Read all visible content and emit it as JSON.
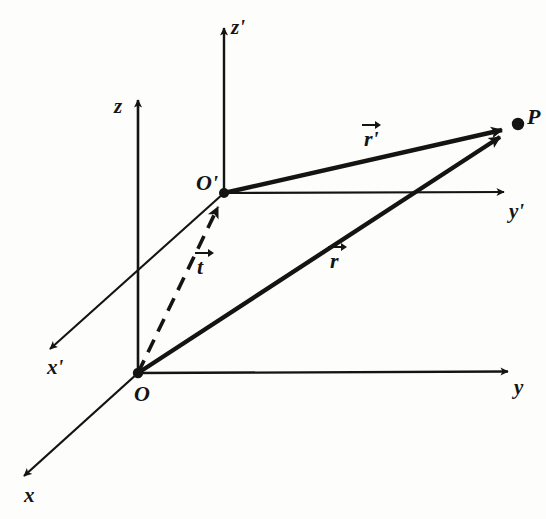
{
  "figure": {
    "background_color": "#fdfdfc",
    "stroke_color": "#141414",
    "width": 546,
    "height": 519
  },
  "axes": [
    {
      "id": "x",
      "label": "x",
      "from": [
        138,
        373
      ],
      "to": [
        18,
        482
      ],
      "label_pos": [
        24,
        485
      ],
      "style": "solid",
      "arrow": "end"
    },
    {
      "id": "y",
      "label": "y",
      "from": [
        138,
        373
      ],
      "to": [
        516,
        371
      ],
      "label_pos": [
        514,
        377
      ],
      "style": "solid",
      "arrow": "end"
    },
    {
      "id": "z",
      "label": "z",
      "from": [
        138,
        373
      ],
      "to": [
        138,
        91
      ],
      "label_pos": [
        114,
        96
      ],
      "style": "solid",
      "arrow": "end"
    },
    {
      "id": "x-prime",
      "label": "x'",
      "from": [
        224,
        193
      ],
      "to": [
        43,
        355
      ],
      "label_pos": [
        47,
        357
      ],
      "style": "solid",
      "arrow": "end"
    },
    {
      "id": "y-prime",
      "label": "y'",
      "from": [
        224,
        193
      ],
      "to": [
        512,
        192
      ],
      "label_pos": [
        509,
        201
      ],
      "style": "solid",
      "arrow": "end"
    },
    {
      "id": "z-prime",
      "label": "z'",
      "from": [
        224,
        193
      ],
      "to": [
        224,
        19
      ],
      "label_pos": [
        231,
        17
      ],
      "style": "solid",
      "arrow": "end"
    }
  ],
  "points": [
    {
      "id": "O",
      "label": "O",
      "pos": [
        138,
        373
      ],
      "label_pos": [
        134,
        383
      ],
      "dot": true
    },
    {
      "id": "O-prime",
      "label": "O'",
      "pos": [
        224,
        193
      ],
      "label_pos": [
        196,
        172
      ],
      "dot": true
    },
    {
      "id": "P",
      "label": "P",
      "pos": [
        518,
        124
      ],
      "label_pos": [
        527,
        106
      ],
      "dot": true
    }
  ],
  "vectors": [
    {
      "id": "r-prime",
      "symbol": "r'",
      "base_symbol": "r",
      "prime": "'",
      "from": [
        224,
        193
      ],
      "to": [
        510,
        128
      ],
      "style": "solid",
      "width": 4.2,
      "label_pos": [
        361,
        120
      ]
    },
    {
      "id": "r",
      "symbol": "r",
      "base_symbol": "r",
      "prime": "",
      "from": [
        138,
        373
      ],
      "to": [
        508,
        132
      ],
      "style": "solid",
      "width": 4.2,
      "label_pos": [
        327,
        242
      ]
    },
    {
      "id": "t",
      "symbol": "t",
      "base_symbol": "t",
      "prime": "",
      "from": [
        138,
        373
      ],
      "to": [
        222,
        198
      ],
      "style": "dashed",
      "width": 3.4,
      "label_pos": [
        194,
        248
      ]
    }
  ]
}
